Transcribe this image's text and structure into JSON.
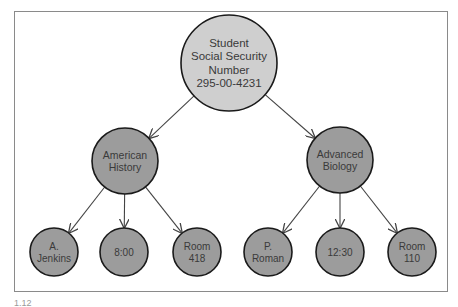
{
  "diagram": {
    "type": "tree",
    "colors": {
      "root_fill": "#cfcfcf",
      "node_fill": "#9c9c9c",
      "stroke": "#1a1a1a",
      "edge": "#444444",
      "frame": "#8a8a8a"
    },
    "root": {
      "id": "root",
      "lines": [
        "Student",
        "Social Security",
        "Number",
        "295-00-4231"
      ],
      "cx": 229,
      "cy": 63,
      "r": 48
    },
    "nodes": [
      {
        "id": "american-history",
        "lines": [
          "American",
          "History"
        ],
        "cx": 125,
        "cy": 161,
        "r": 33,
        "parent": "root"
      },
      {
        "id": "advanced-biology",
        "lines": [
          "Advanced",
          "Biology"
        ],
        "cx": 340,
        "cy": 160,
        "r": 33,
        "parent": "root"
      },
      {
        "id": "a-jenkins",
        "lines": [
          "A.",
          "Jenkins"
        ],
        "cx": 54,
        "cy": 252,
        "r": 24,
        "parent": "american-history"
      },
      {
        "id": "time-800",
        "lines": [
          "8:00"
        ],
        "cx": 124,
        "cy": 252,
        "r": 24,
        "parent": "american-history"
      },
      {
        "id": "room-418",
        "lines": [
          "Room",
          "418"
        ],
        "cx": 197,
        "cy": 252,
        "r": 24,
        "parent": "american-history"
      },
      {
        "id": "p-roman",
        "lines": [
          "P.",
          "Roman"
        ],
        "cx": 268,
        "cy": 252,
        "r": 24,
        "parent": "advanced-biology"
      },
      {
        "id": "time-1230",
        "lines": [
          "12:30"
        ],
        "cx": 340,
        "cy": 252,
        "r": 24,
        "parent": "advanced-biology"
      },
      {
        "id": "room-110",
        "lines": [
          "Room",
          "110"
        ],
        "cx": 412,
        "cy": 252,
        "r": 24,
        "parent": "advanced-biology"
      }
    ]
  },
  "caption": "1.12"
}
